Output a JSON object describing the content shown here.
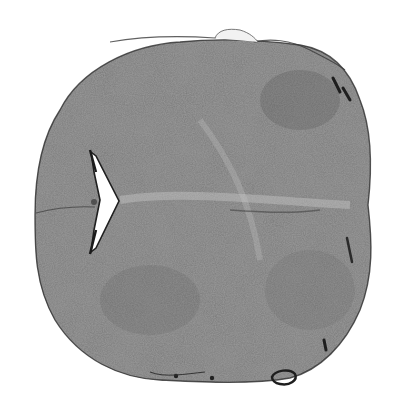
{
  "image": {
    "subject": "grayscale histological tissue section (brain/spinal cord cross-section)",
    "background_color": "#ffffff",
    "tissue_color": "#8a8a8a",
    "tissue_dark_color": "#5a5a5a",
    "outline_color": "#3a3a3a",
    "ventricle_color": "#ffffff"
  }
}
